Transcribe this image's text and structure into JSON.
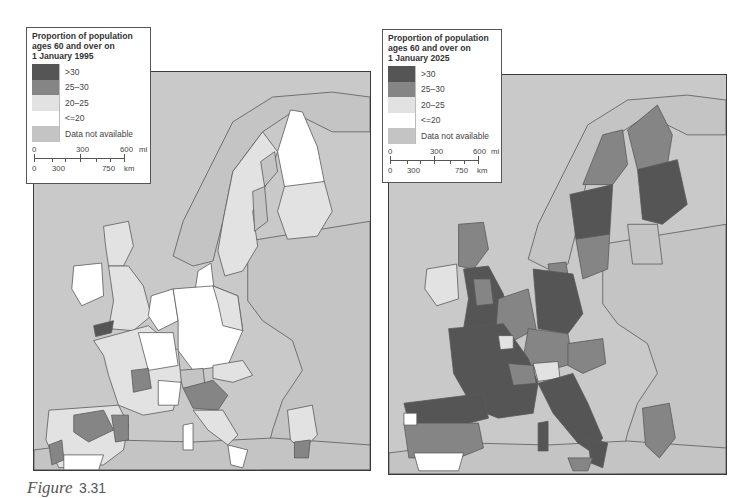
{
  "colors": {
    "gt30": "#555555",
    "25_30": "#858585",
    "20_25": "#e2e2e2",
    "le20": "#ffffff",
    "na": "#c4c4c4",
    "sea": "#c9c9c9",
    "border": "#5a5a5a"
  },
  "maps": [
    {
      "legend": {
        "title_line1": "Proportion of population",
        "title_line2": "ages 60 and over on",
        "title_line3": "1 January 1995",
        "items": [
          {
            "label": ">30",
            "key": "gt30"
          },
          {
            "label": "25–30",
            "key": "25_30"
          },
          {
            "label": "20–25",
            "key": "20_25"
          },
          {
            "label": "<=20",
            "key": "le20"
          },
          {
            "label": "Data not available",
            "key": "na"
          }
        ],
        "scale": {
          "mi_0": "0",
          "mi_mid": "300",
          "mi_max": "600",
          "mi_unit": "mi",
          "km_0": "0",
          "km_mid": "300",
          "km_max": "750",
          "km_unit": "km"
        }
      },
      "year": "1995"
    },
    {
      "legend": {
        "title_line1": "Proportion of population",
        "title_line2": "ages 60 and over on",
        "title_line3": "1 January 2025",
        "items": [
          {
            "label": ">30",
            "key": "gt30"
          },
          {
            "label": "25–30",
            "key": "25_30"
          },
          {
            "label": "20–25",
            "key": "20_25"
          },
          {
            "label": "<=20",
            "key": "le20"
          },
          {
            "label": "Data not available",
            "key": "na"
          }
        ],
        "scale": {
          "mi_0": "0",
          "mi_mid": "300",
          "mi_max": "600",
          "mi_unit": "mi",
          "km_0": "0",
          "km_mid": "300",
          "km_max": "750",
          "km_unit": "km"
        }
      },
      "year": "2025"
    }
  ],
  "caption": {
    "prefix": "Figure",
    "number": "3.31"
  }
}
